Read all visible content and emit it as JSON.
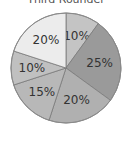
{
  "chart_data": {
    "type": "pie",
    "title": "Third Rounder",
    "categories": [
      "A",
      "B",
      "C",
      "D",
      "E",
      "F"
    ],
    "values": [
      10,
      25,
      20,
      15,
      10,
      20
    ],
    "labels": [
      "10%",
      "25%",
      "20%",
      "15%",
      "10%",
      "20%"
    ],
    "colors": [
      "#c4c4c4",
      "#9a9a9a",
      "#b0b0b0",
      "#b8b8b8",
      "#c0c0c0",
      "#ececec"
    ],
    "start_angle_deg": 0,
    "direction": "clockwise",
    "legend": "none"
  }
}
